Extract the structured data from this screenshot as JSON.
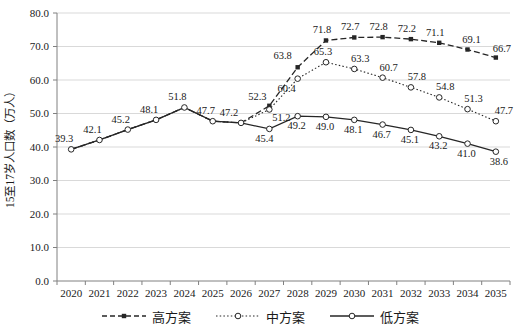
{
  "chart_data": {
    "type": "line",
    "title": "",
    "xlabel": "",
    "ylabel": "15至17岁人口数（万人）",
    "categories": [
      "2020",
      "2021",
      "2022",
      "2023",
      "2024",
      "2025",
      "2026",
      "2027",
      "2028",
      "2029",
      "2030",
      "2031",
      "2032",
      "2033",
      "2034",
      "2035"
    ],
    "ylim": [
      0,
      80
    ],
    "ytick_step": 10,
    "grid": "horizontal",
    "legend_position": "bottom",
    "diverge_from_index": 7,
    "colors": {
      "line": "#262626",
      "grid": "#d9d9d9",
      "axis": "#808080",
      "text": "#1a1a1a",
      "background": "#ffffff"
    },
    "series": [
      {
        "name": "高方案",
        "line_style": "dashed",
        "marker": "filled-square",
        "values": [
          39.3,
          42.1,
          45.2,
          48.1,
          51.8,
          47.7,
          47.2,
          52.3,
          63.8,
          71.8,
          72.7,
          72.8,
          72.2,
          71.1,
          69.1,
          66.7
        ]
      },
      {
        "name": "中方案",
        "line_style": "dotted",
        "marker": "open-circle",
        "values": [
          39.3,
          42.1,
          45.2,
          48.1,
          51.8,
          47.7,
          47.2,
          51.2,
          60.4,
          65.3,
          63.3,
          60.7,
          57.8,
          54.8,
          51.3,
          47.7
        ]
      },
      {
        "name": "低方案",
        "line_style": "solid",
        "marker": "open-circle",
        "values": [
          39.3,
          42.1,
          45.2,
          48.1,
          51.8,
          47.7,
          47.2,
          45.4,
          49.2,
          49.0,
          48.1,
          46.7,
          45.1,
          43.2,
          41.0,
          38.6
        ]
      }
    ]
  }
}
